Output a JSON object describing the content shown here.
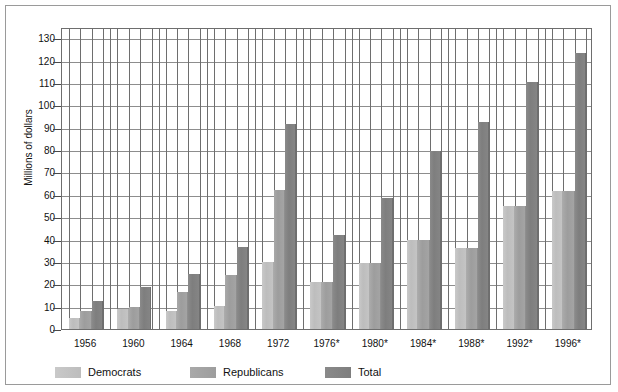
{
  "chart_data": {
    "type": "bar",
    "title": "",
    "xlabel": "",
    "ylabel": "Millions of dollars",
    "ylim": [
      0,
      135
    ],
    "yticks": [
      0,
      10,
      20,
      30,
      40,
      50,
      60,
      70,
      80,
      90,
      100,
      110,
      120,
      130
    ],
    "grid": true,
    "legend_position": "bottom-left",
    "categories": [
      "1956",
      "1960",
      "1964",
      "1968",
      "1972",
      "1976*",
      "1980*",
      "1984*",
      "1988*",
      "1992*",
      "1996*"
    ],
    "series": [
      {
        "name": "Democrats",
        "color": "#c2c2c2",
        "values": [
          5,
          9,
          8,
          10.5,
          30,
          21,
          29.5,
          40,
          36,
          55,
          61.5
        ]
      },
      {
        "name": "Republicans",
        "color": "#a2a2a2",
        "values": [
          8,
          10,
          16.5,
          24,
          62,
          21,
          29.5,
          40,
          36,
          55,
          61.5
        ]
      },
      {
        "name": "Total",
        "color": "#828282",
        "values": [
          12.5,
          19,
          24.5,
          36.5,
          91.5,
          42,
          58.5,
          79.5,
          92.5,
          110.5,
          123.5
        ]
      }
    ]
  },
  "axes": {
    "y_tick_labels": [
      "0",
      "10",
      "20",
      "30",
      "40",
      "50",
      "60",
      "70",
      "80",
      "90",
      "100",
      "110",
      "120",
      "130"
    ],
    "y_axis_title": "Millions of dollars",
    "x_tick_labels": [
      "1956",
      "1960",
      "1964",
      "1968",
      "1972",
      "1976*",
      "1980*",
      "1984*",
      "1988*",
      "1992*",
      "1996*"
    ]
  },
  "legend": {
    "items": [
      {
        "label": "Democrats",
        "color": "#c2c2c2"
      },
      {
        "label": "Republicans",
        "color": "#a2a2a2"
      },
      {
        "label": "Total",
        "color": "#828282"
      }
    ]
  }
}
